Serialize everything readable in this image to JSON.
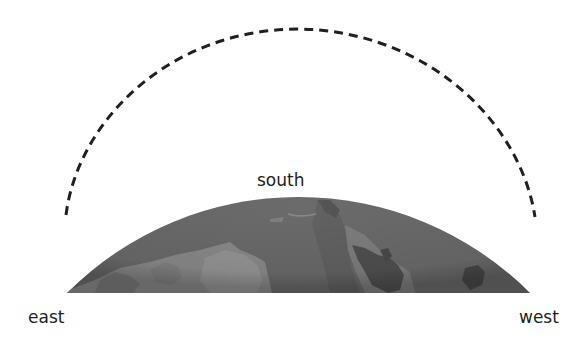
{
  "diagram": {
    "type": "sun-path-over-horizon",
    "labels": {
      "south": "south",
      "east": "east",
      "west": "west"
    },
    "arc": {
      "style": "dashed",
      "color": "#231f20",
      "description": "path across the sky from east to west, peaking over south"
    },
    "globe": {
      "ocean_color": "#6b6b6b",
      "land_light_color": "#8e8e8e",
      "land_dark_color": "#505050"
    }
  }
}
